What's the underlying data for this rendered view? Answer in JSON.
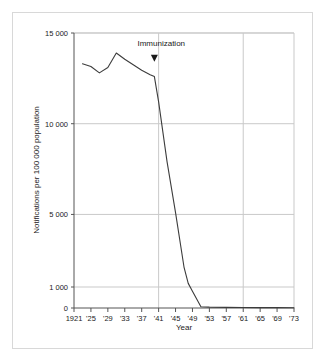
{
  "figure": {
    "background_color": "#ffffff",
    "frame_color": "#d8d8d8"
  },
  "chart_data": {
    "type": "line",
    "title": "",
    "subtitle": "",
    "xlabel": "Year",
    "ylabel": "Notifications per 100 000 population",
    "xlim": [
      1921,
      1973
    ],
    "ylim": [
      0,
      15000
    ],
    "grid": true,
    "legend_position": "none",
    "line_color": "#3c3c3c",
    "grid_color": "#c9c9c9",
    "axis_color": "#555555",
    "x_tick_labels": [
      "1921",
      "'25",
      "'29",
      "'33",
      "'37",
      "'41",
      "'45",
      "'49",
      "'53",
      "'57",
      "'61",
      "'65",
      "'69",
      "'73"
    ],
    "x_tick_values": [
      1921,
      1925,
      1929,
      1933,
      1937,
      1941,
      1945,
      1949,
      1953,
      1957,
      1961,
      1965,
      1969,
      1973
    ],
    "y_tick_labels": [
      "15 000",
      "10 000",
      "5 000",
      "1 000",
      "0"
    ],
    "y_tick_values": [
      15000,
      10000,
      5000,
      1000,
      0
    ],
    "y_gridlines": [
      15000,
      10000,
      5000,
      1000
    ],
    "x_gridlines": [
      1941,
      1961
    ],
    "series": [
      {
        "name": "Diphtheria notifications",
        "x": [
          1923,
          1925,
          1927,
          1929,
          1931,
          1933,
          1935,
          1937,
          1939,
          1940,
          1941,
          1943,
          1945,
          1947,
          1948,
          1949,
          1951,
          1953,
          1957,
          1961,
          1965,
          1969,
          1973
        ],
        "values": [
          13300,
          13150,
          12800,
          13100,
          13900,
          13550,
          13250,
          12950,
          12700,
          12600,
          11200,
          7900,
          5100,
          2100,
          1200,
          800,
          60,
          40,
          30,
          25,
          20,
          18,
          15
        ]
      }
    ],
    "annotations": [
      {
        "label": "Immunization",
        "x": 1940,
        "marker": "down-triangle",
        "label_x": 1936,
        "label_y": 14300,
        "marker_y": 13300
      }
    ]
  }
}
